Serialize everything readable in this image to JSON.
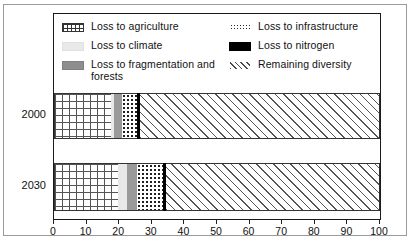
{
  "chart_data": {
    "type": "bar",
    "orientation": "horizontal",
    "stacked": true,
    "title": "",
    "xlabel": "",
    "ylabel": "",
    "xlim": [
      0,
      100
    ],
    "xticks": [
      0,
      10,
      20,
      30,
      40,
      50,
      60,
      70,
      80,
      90,
      100
    ],
    "grid": false,
    "legend_position": "top-inside",
    "categories": [
      "2000",
      "2030"
    ],
    "series": [
      {
        "name": "Loss to agriculture",
        "pattern": "grid",
        "values": [
          17.5,
          19.5
        ]
      },
      {
        "name": "Loss to climate",
        "pattern": "light-gray",
        "values": [
          1.0,
          3.0
        ]
      },
      {
        "name": "Loss to fragmentation and forests",
        "pattern": "medium-gray",
        "values": [
          2.5,
          3.0
        ]
      },
      {
        "name": "Loss to infrastructure",
        "pattern": "dotted",
        "values": [
          4.5,
          8.0
        ]
      },
      {
        "name": "Loss to nitrogen",
        "pattern": "solid-black",
        "values": [
          1.0,
          1.0
        ]
      },
      {
        "name": "Remaining diversity",
        "pattern": "diagonal-hatch",
        "values": [
          73.5,
          65.5
        ]
      }
    ]
  },
  "legend": {
    "left_column": [
      {
        "label": "Loss to agriculture",
        "swatch": "grid-swatch"
      },
      {
        "label": "Loss to climate",
        "swatch": "light-gray-swatch"
      },
      {
        "label": "Loss to fragmentation and forests",
        "swatch": "medium-gray-swatch"
      }
    ],
    "right_column": [
      {
        "label": "Loss to infrastructure",
        "swatch": "dotted-swatch"
      },
      {
        "label": "Loss to nitrogen",
        "swatch": "black-swatch"
      },
      {
        "label": "Remaining diversity",
        "swatch": "hatch-swatch"
      }
    ]
  },
  "axis": {
    "tick_labels": [
      "0",
      "10",
      "20",
      "30",
      "40",
      "50",
      "60",
      "70",
      "80",
      "90",
      "100"
    ]
  },
  "colors": {
    "frame": "#9a9a9a",
    "panel_border": "#1a1a1a",
    "climate": "#e8e8e8",
    "fragmentation": "#9a9a9a",
    "nitrogen": "#000000",
    "text": "#111111"
  }
}
